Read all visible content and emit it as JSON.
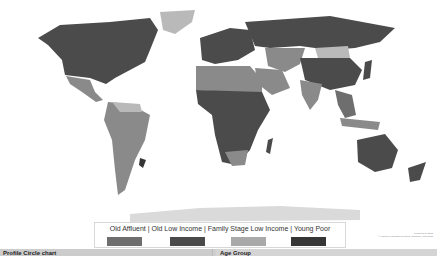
{
  "map": {
    "type": "choropleth-world-map",
    "legend": {
      "title": "Old Affluent  |  Old Low Income | Family Stage Low Income | Young Poor",
      "items": [
        {
          "label": "Old Affluent",
          "color": "#6e6e6e"
        },
        {
          "label": "Old Low Income",
          "color": "#4a4a4a"
        },
        {
          "label": "Family Stage Low Income",
          "color": "#a9a9a9"
        },
        {
          "label": "Young Poor",
          "color": "#353535"
        }
      ]
    },
    "attribution": {
      "line1": "Powered by Bing",
      "line2": "© Navteq, Thomson Reuters, TomTom, Wikipedia"
    },
    "colors": {
      "dark": "#4b4b4b",
      "mid": "#8a8a8a",
      "light": "#b9b9b9",
      "ocean": "#ffffff"
    }
  },
  "bottom_bar": {
    "left_label": "Profile Circle chart",
    "right_label": "Age Group"
  }
}
